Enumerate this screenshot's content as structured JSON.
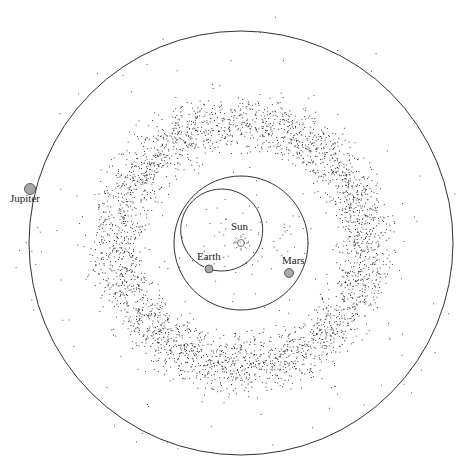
{
  "diagram": {
    "sun": {
      "label": "Sun",
      "x": 241,
      "y": 243
    },
    "planets": [
      {
        "label": "Earth",
        "orbit_r": 41,
        "x": 209,
        "y": 269
      },
      {
        "label": "Mars",
        "orbit_r": 67,
        "x": 289,
        "y": 273
      },
      {
        "label": "Jupiter",
        "orbit_r": 212,
        "x": 30,
        "y": 189
      }
    ],
    "belt": {
      "inner_r": 85,
      "outer_r": 165,
      "count": 3200
    },
    "colors": {
      "orbit": "#333333",
      "planet_fill": "#a8a8a8",
      "dots": "#111111"
    }
  }
}
